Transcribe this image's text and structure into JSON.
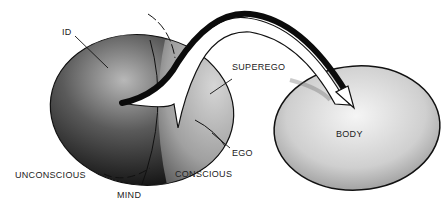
{
  "diagram": {
    "labels": {
      "id": "ID",
      "superego": "SUPEREGO",
      "ego": "EGO",
      "body": "BODY",
      "unconscious": "UNCONSCIOUS",
      "conscious": "CONSCIOUS",
      "mind": "MIND"
    },
    "colors": {
      "mind_dark": "#1a1a1a",
      "mind_light": "#8a8a8a",
      "body_fill": "#cfcfcf",
      "outline": "#111111"
    }
  }
}
